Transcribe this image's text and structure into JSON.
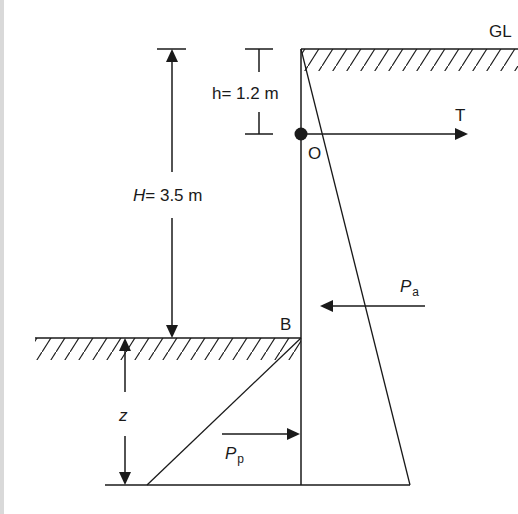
{
  "diagram": {
    "type": "sheet pile wall with anchor (free earth support)",
    "labels": {
      "ground_level": "GL",
      "anchor_height": "h = 1.2 m",
      "anchor_height_var": "h",
      "anchor_height_value": "= 1.2 m",
      "retained_height_var": "H",
      "retained_height_value": "= 3.5 m",
      "anchor_point": "O",
      "anchor_force": "T",
      "dredge_level_point": "B",
      "embedment_depth": "z",
      "active_force_main": "P",
      "active_force_sub": "a",
      "passive_force_main": "P",
      "passive_force_sub": "p"
    },
    "values": {
      "h_m": 1.2,
      "H_m": 3.5
    },
    "colors": {
      "line": "#1a1a1a",
      "background": "#ffffff",
      "edge_strip": "#d9d9d9"
    }
  }
}
